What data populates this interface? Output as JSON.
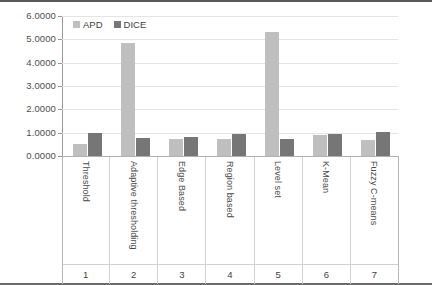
{
  "chart_data": {
    "type": "bar",
    "title": "",
    "xlabel": "",
    "ylabel": "",
    "ylim": [
      0,
      6
    ],
    "grid": true,
    "legend_position": "top-left",
    "categories": [
      "Threshold",
      "Adaptive thresholding",
      "Edge Based",
      "Region based",
      "Level set",
      "K-Mean",
      "Fuzzy C-means"
    ],
    "category_numbers": [
      "1",
      "2",
      "3",
      "4",
      "5",
      "6",
      "7"
    ],
    "ytick_labels": [
      "0.0000",
      "1.0000",
      "2.0000",
      "3.0000",
      "4.0000",
      "5.0000",
      "6.0000"
    ],
    "ytick_values": [
      0,
      1,
      2,
      3,
      4,
      5,
      6
    ],
    "series": [
      {
        "name": "APD",
        "color": "#bfbfbf",
        "values": [
          0.53,
          4.85,
          0.72,
          0.75,
          5.3,
          0.9,
          0.68
        ]
      },
      {
        "name": "DICE",
        "color": "#767676",
        "values": [
          0.97,
          0.78,
          0.8,
          0.95,
          0.72,
          0.95,
          1.02
        ]
      }
    ]
  },
  "legend": {
    "items": [
      {
        "label": "APD",
        "swatch": "apd"
      },
      {
        "label": "DICE",
        "swatch": "dice"
      }
    ]
  }
}
